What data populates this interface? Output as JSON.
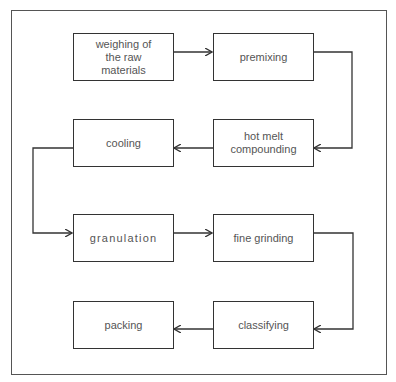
{
  "diagram": {
    "type": "flowchart",
    "title": "",
    "steps": [
      {
        "id": "weighing",
        "label": "weighing of\nthe raw\nmaterials"
      },
      {
        "id": "premixing",
        "label": "premixing"
      },
      {
        "id": "hot_melt",
        "label": "hot melt\ncompounding"
      },
      {
        "id": "cooling",
        "label": "cooling"
      },
      {
        "id": "granulation",
        "label": "granulation"
      },
      {
        "id": "fine_grinding",
        "label": "fine grinding"
      },
      {
        "id": "classifying",
        "label": "classifying"
      },
      {
        "id": "packing",
        "label": "packing"
      }
    ],
    "edges": [
      {
        "from": "weighing",
        "to": "premixing"
      },
      {
        "from": "premixing",
        "to": "hot_melt"
      },
      {
        "from": "hot_melt",
        "to": "cooling"
      },
      {
        "from": "cooling",
        "to": "granulation"
      },
      {
        "from": "granulation",
        "to": "fine_grinding"
      },
      {
        "from": "fine_grinding",
        "to": "classifying"
      },
      {
        "from": "classifying",
        "to": "packing"
      }
    ],
    "colors": {
      "line": "#333333",
      "text": "#555555",
      "background": "#ffffff"
    }
  }
}
